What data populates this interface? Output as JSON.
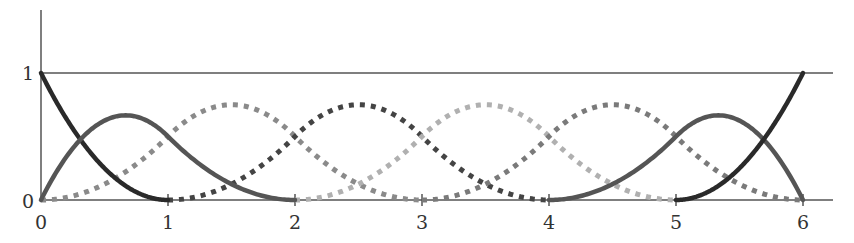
{
  "chart_data": {
    "type": "line",
    "title": "",
    "xlabel": "",
    "ylabel": "",
    "xlim": [
      0,
      6.25
    ],
    "ylim": [
      0,
      1.5
    ],
    "grid": false,
    "legend": null,
    "x_ticks": [
      "0",
      "1",
      "2",
      "3",
      "4",
      "5",
      "6"
    ],
    "y_ticks": [
      "0",
      "1"
    ],
    "reference_lines": [
      {
        "y": 1,
        "style": "thin solid"
      }
    ],
    "series": [
      {
        "name": "B0",
        "style": "solid",
        "color": "#2a2a2a",
        "x": [
          0,
          0.25,
          0.5,
          0.75,
          1
        ],
        "values": [
          1,
          0.5625,
          0.25,
          0.0625,
          0
        ]
      },
      {
        "name": "B1",
        "style": "solid",
        "color": "#555555",
        "x": [
          0,
          0.25,
          0.5,
          0.667,
          1,
          1.5,
          2
        ],
        "values": [
          0,
          0.406,
          0.625,
          0.667,
          0.5,
          0.125,
          0
        ]
      },
      {
        "name": "B2",
        "style": "dotted",
        "color": "#8a8a8a",
        "x": [
          0,
          0.5,
          1,
          1.5,
          2,
          2.5,
          3
        ],
        "values": [
          0,
          0.125,
          0.5,
          0.75,
          0.5,
          0.125,
          0
        ]
      },
      {
        "name": "B3",
        "style": "dotted",
        "color": "#444444",
        "x": [
          1,
          1.5,
          2,
          2.5,
          3,
          3.5,
          4
        ],
        "values": [
          0,
          0.125,
          0.5,
          0.75,
          0.5,
          0.125,
          0
        ]
      },
      {
        "name": "B4",
        "style": "dotted",
        "color": "#b0b0b0",
        "x": [
          2,
          2.5,
          3,
          3.5,
          4,
          4.5,
          5
        ],
        "values": [
          0,
          0.125,
          0.5,
          0.75,
          0.5,
          0.125,
          0
        ]
      },
      {
        "name": "B5",
        "style": "dotted",
        "color": "#7a7a7a",
        "x": [
          3,
          3.5,
          4,
          4.5,
          5,
          5.5,
          6
        ],
        "values": [
          0,
          0.125,
          0.5,
          0.75,
          0.5,
          0.125,
          0
        ]
      },
      {
        "name": "B6",
        "style": "solid",
        "color": "#555555",
        "x": [
          4,
          4.5,
          5,
          5.333,
          5.5,
          5.75,
          6
        ],
        "values": [
          0,
          0.125,
          0.5,
          0.667,
          0.625,
          0.406,
          0
        ]
      },
      {
        "name": "B7",
        "style": "solid",
        "color": "#2a2a2a",
        "x": [
          5,
          5.25,
          5.5,
          5.75,
          6
        ],
        "values": [
          0,
          0.0625,
          0.25,
          0.5625,
          1
        ]
      }
    ]
  },
  "axes": {
    "x_tick_labels": [
      "0",
      "1",
      "2",
      "3",
      "4",
      "5",
      "6"
    ],
    "y_tick_labels": [
      "0",
      "1"
    ]
  }
}
